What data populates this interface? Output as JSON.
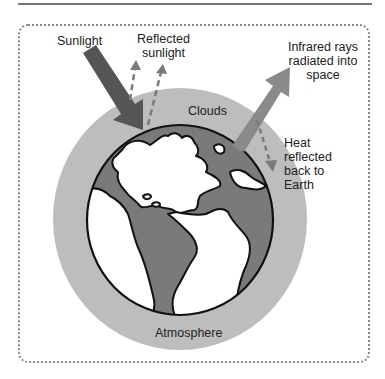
{
  "diagram": {
    "type": "greenhouse-effect",
    "labels": {
      "sunlight": "Sunlight",
      "reflected_sunlight_line1": "Reflected",
      "reflected_sunlight_line2": "sunlight",
      "infrared_line1": "Infrared rays",
      "infrared_line2": "radiated into",
      "infrared_line3": "space",
      "clouds": "Clouds",
      "heat_line1": "Heat",
      "heat_line2": "reflected",
      "heat_line3": "back to",
      "heat_line4": "Earth",
      "atmosphere": "Atmosphere"
    },
    "colors": {
      "atmosphere": "#bdbdbd",
      "ocean": "#7a7a7a",
      "land": "#ffffff",
      "sunlight_arrow": "#555555",
      "infrared_arrow": "#8a8a8a",
      "dashed_arrow": "#7a7a7a",
      "outline": "#111111"
    }
  }
}
